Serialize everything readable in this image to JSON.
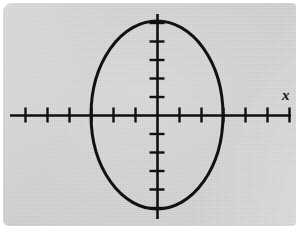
{
  "figure": {
    "background_color": "#d2d2d2",
    "page_color": "#ffffff",
    "ink_color": "#111111",
    "x_axis_label": "x"
  },
  "chart_data": {
    "type": "line",
    "title": "",
    "subtitle": "",
    "xlabel": "x",
    "ylabel": "",
    "grid": false,
    "legend": null,
    "annotations": [],
    "axes": {
      "origin_px": [
        157,
        115
      ],
      "x_tick_spacing_px": 22,
      "y_tick_spacing_px": 18.5,
      "x_axis_extent_px": [
        10,
        291
      ],
      "y_axis_extent_px": [
        14,
        219
      ],
      "x_ticks_units": [
        -6,
        -5,
        -4,
        -3,
        -2,
        -1,
        1,
        2,
        3,
        4,
        5,
        6
      ],
      "y_ticks_units": [
        -5,
        -4,
        -3,
        -2,
        -1,
        1,
        2,
        3,
        4,
        5
      ],
      "tick_labels_shown": false,
      "xlim": [
        -6.7,
        6.1
      ],
      "ylim": [
        -5.5,
        5.5
      ]
    },
    "series": [
      {
        "name": "ellipse",
        "shape": "ellipse",
        "center": [
          0,
          0
        ],
        "semi_axis_x_units": 3,
        "semi_axis_y_units": 5,
        "semi_axis_x_px": 66,
        "semi_axis_y_px": 94,
        "x_intercepts": [
          -3,
          3
        ],
        "y_intercepts": [
          -5,
          5
        ],
        "equation": "x^2/9 + y^2/25 = 1",
        "stroke_color": "#111111",
        "stroke_width_px": 3,
        "fill": "none"
      }
    ]
  }
}
